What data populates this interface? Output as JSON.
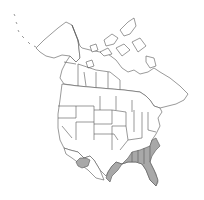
{
  "map": {
    "type": "range-map",
    "region": "North America",
    "background": "#ffffff",
    "outline_color": "#555555",
    "fill_color": "#ffffff",
    "range_fill_color": "#a8a8a8",
    "range_areas": [
      "southeastern-united-states",
      "southern-arizona"
    ]
  }
}
